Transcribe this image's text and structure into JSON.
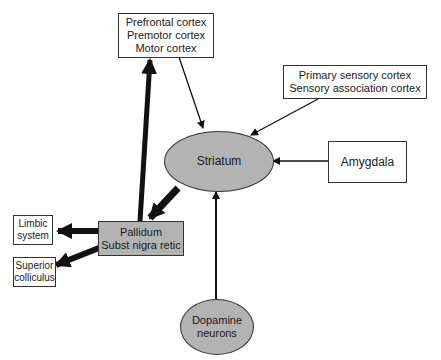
{
  "nodes": {
    "frontal": {
      "lines": [
        "Prefrontal cortex",
        "Premotor cortex",
        "Motor cortex"
      ],
      "shape": "box"
    },
    "sensory": {
      "lines": [
        "Primary sensory cortex",
        "Sensory association cortex"
      ],
      "shape": "box"
    },
    "striatum": {
      "label": "Striatum",
      "shape": "ellipse",
      "fill": "#b3b3b3"
    },
    "amygdala": {
      "label": "Amygdala",
      "shape": "box"
    },
    "pallidum": {
      "lines": [
        "Pallidum",
        "Subst nigra retic"
      ],
      "shape": "box",
      "fill": "#b3b3b3"
    },
    "limbic": {
      "lines": [
        "Limbic",
        "system"
      ],
      "shape": "box"
    },
    "colliculus": {
      "lines": [
        "Superior",
        "colliculus"
      ],
      "shape": "box"
    },
    "dopamine": {
      "lines": [
        "Dopamine",
        "neurons"
      ],
      "shape": "ellipse",
      "fill": "#b3b3b3"
    }
  },
  "edges": [
    {
      "from": "frontal",
      "to": "striatum",
      "weight": "thin"
    },
    {
      "from": "sensory",
      "to": "striatum",
      "weight": "thin"
    },
    {
      "from": "amygdala",
      "to": "striatum",
      "weight": "thin"
    },
    {
      "from": "dopamine",
      "to": "striatum",
      "weight": "thin"
    },
    {
      "from": "striatum",
      "to": "pallidum",
      "weight": "thick"
    },
    {
      "from": "pallidum",
      "to": "frontal",
      "weight": "thick"
    },
    {
      "from": "pallidum",
      "to": "limbic",
      "weight": "thick"
    },
    {
      "from": "pallidum",
      "to": "colliculus",
      "weight": "thick"
    }
  ]
}
